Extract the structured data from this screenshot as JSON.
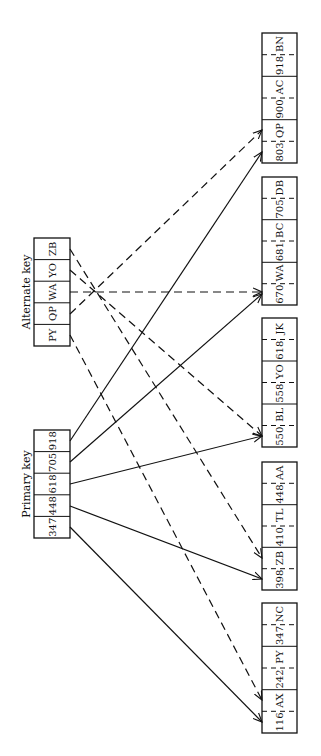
{
  "labels": {
    "primary_key": "Primary key",
    "alternate_key": "Alternate key"
  },
  "primary_key": {
    "cells": [
      "347",
      "448",
      "618",
      "705",
      "918"
    ]
  },
  "alternate_key": {
    "cells": [
      "PY",
      "QP",
      "WA",
      "YO",
      "ZB"
    ]
  },
  "records": [
    {
      "cells": [
        "116",
        "AX",
        "242",
        "PY",
        "347",
        "NC"
      ]
    },
    {
      "cells": [
        "398",
        "ZB",
        "410",
        "TL",
        "448",
        "AA"
      ]
    },
    {
      "cells": [
        "550",
        "BL",
        "558",
        "YO",
        "618",
        "JK"
      ]
    },
    {
      "cells": [
        "670",
        "WA",
        "681",
        "BC",
        "705",
        "DB"
      ]
    },
    {
      "cells": [
        "803",
        "QP",
        "900",
        "AC",
        "918",
        "BN"
      ]
    }
  ],
  "links": {
    "primary": [
      {
        "from": "347",
        "to_record": 0
      },
      {
        "from": "448",
        "to_record": 1
      },
      {
        "from": "618",
        "to_record": 2
      },
      {
        "from": "705",
        "to_record": 3
      },
      {
        "from": "918",
        "to_record": 4
      }
    ],
    "alternate": [
      {
        "from": "PY",
        "to_record": 0
      },
      {
        "from": "QP",
        "to_record": 4
      },
      {
        "from": "WA",
        "to_record": 3
      },
      {
        "from": "YO",
        "to_record": 2
      },
      {
        "from": "ZB",
        "to_record": 1
      }
    ]
  }
}
